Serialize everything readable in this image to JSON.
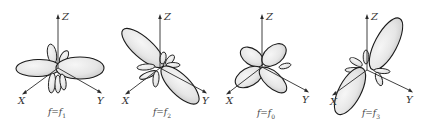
{
  "figure": {
    "panels": [
      {
        "id": "f1",
        "caption_prefix": "f=f",
        "caption_sub": "1",
        "axis_labels": {
          "z": "Z",
          "x": "X",
          "y": "Y"
        },
        "main_lobe_direction": "horizontal (along -X/+Y plane, broadside)"
      },
      {
        "id": "f2",
        "caption_prefix": "f=f",
        "caption_sub": "2",
        "axis_labels": {
          "z": "Z",
          "x": "X",
          "y": "Y"
        },
        "main_lobe_direction": "tilted upper-left / lower-right"
      },
      {
        "id": "f0",
        "caption_prefix": "f=f",
        "caption_sub": "0",
        "axis_labels": {
          "z": "Z",
          "x": "X",
          "y": "Y"
        },
        "main_lobe_direction": "four-leaf cross pattern"
      },
      {
        "id": "f3",
        "caption_prefix": "f=f",
        "caption_sub": "3",
        "axis_labels": {
          "z": "Z",
          "x": "X",
          "y": "Y"
        },
        "main_lobe_direction": "tilted upper-right / lower-left"
      }
    ]
  },
  "colors": {
    "outline": "#1a1a1a",
    "fill_light": "#f4f4f4",
    "fill_dark": "#cfcfcf",
    "axis": "#2a2a2a",
    "background": "#ffffff"
  }
}
